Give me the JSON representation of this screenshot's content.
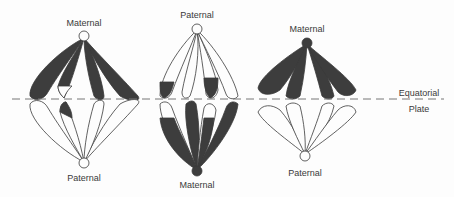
{
  "figure": {
    "colors": {
      "ink": "#3a3a3a",
      "fill": "#3d3d3d",
      "background": "#fdfdfd",
      "dash": "#777777"
    },
    "equatorial_plate": {
      "label_line1": "Equatorial",
      "label_line2": "Plate"
    },
    "spindles": [
      {
        "id": "left",
        "top_pole_label": "Maternal",
        "bottom_pole_label": "Paternal",
        "top_pole_fill": "open",
        "bottom_pole_fill": "open"
      },
      {
        "id": "middle",
        "top_pole_label": "Paternal",
        "bottom_pole_label": "Maternal",
        "top_pole_fill": "open",
        "bottom_pole_fill": "filled"
      },
      {
        "id": "right",
        "top_pole_label": "Maternal",
        "bottom_pole_label": "Paternal",
        "top_pole_fill": "filled",
        "bottom_pole_fill": "open"
      }
    ]
  }
}
